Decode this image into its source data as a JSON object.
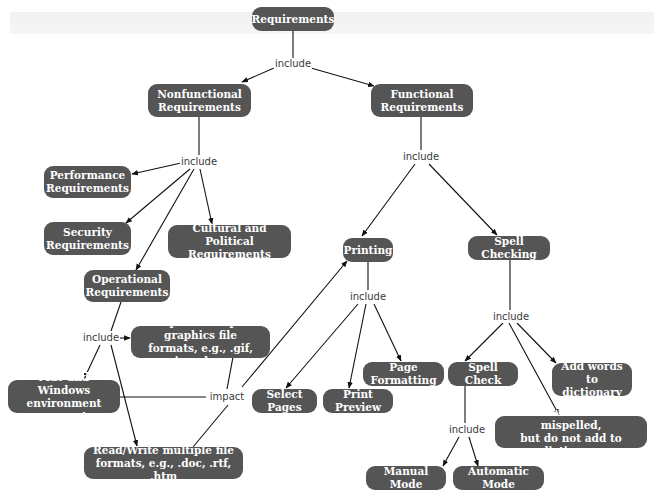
{
  "diagram": {
    "type": "concept-map",
    "node_color": "#555556",
    "text_color": "#ffffff",
    "nodes": {
      "requirements": "Requirements",
      "nonfunctional": "Nonfunctional\nRequirements",
      "functional": "Functional\nRequirements",
      "performance": "Performance\nRequirements",
      "security": "Security\nRequirements",
      "cultural": "Cultural and Political\nRequirements",
      "operational": "Operational\nRequirements",
      "import_graphics": "Import multiple graphics file\nformats, e.g., .gif, .jpg, .bmp",
      "mac_windows": "Mac and Windows\nenvironment support",
      "read_write": "Read/Write multiple file\nformats, e.g., .doc, .rtf, .htm",
      "printing": "Printing",
      "spell_checking": "Spell Checking",
      "select_pages": "Select Pages",
      "print_preview": "Print Preview",
      "page_formatting": "Page Formatting",
      "spell_check": "Spell Check",
      "add_words": "Add words to\ndictionary",
      "mark_words": "Mark words as not mispelled,\nbut do not add to dictionary",
      "manual_mode": "Manual Mode",
      "automatic_mode": "Automatic Mode"
    },
    "link_labels": {
      "include_root": "include",
      "include_nonfunctional": "include",
      "include_functional": "include",
      "include_operational": "include",
      "impact": "impact",
      "include_printing": "include",
      "include_spell_checking": "include",
      "include_spell_check": "include"
    },
    "edges": [
      {
        "from": "Requirements",
        "label": "include",
        "to": [
          "Nonfunctional Requirements",
          "Functional Requirements"
        ]
      },
      {
        "from": "Nonfunctional Requirements",
        "label": "include",
        "to": [
          "Performance Requirements",
          "Security Requirements",
          "Operational Requirements",
          "Cultural and Political Requirements"
        ]
      },
      {
        "from": "Functional Requirements",
        "label": "include",
        "to": [
          "Printing",
          "Spell Checking"
        ]
      },
      {
        "from": "Operational Requirements",
        "label": "include",
        "to": [
          "Import multiple graphics file formats",
          "Mac and Windows environment support",
          "Read/Write multiple file formats"
        ]
      },
      {
        "from": "Mac and Windows environment support",
        "label": "impact",
        "to": [
          "Printing"
        ]
      },
      {
        "from": "Printing",
        "label": "include",
        "to": [
          "Select Pages",
          "Print Preview",
          "Page Formatting"
        ]
      },
      {
        "from": "Spell Checking",
        "label": "include",
        "to": [
          "Spell Check",
          "Add words to dictionary",
          "Mark words as not mispelled"
        ]
      },
      {
        "from": "Spell Check",
        "label": "include",
        "to": [
          "Manual Mode",
          "Automatic Mode"
        ]
      }
    ]
  }
}
